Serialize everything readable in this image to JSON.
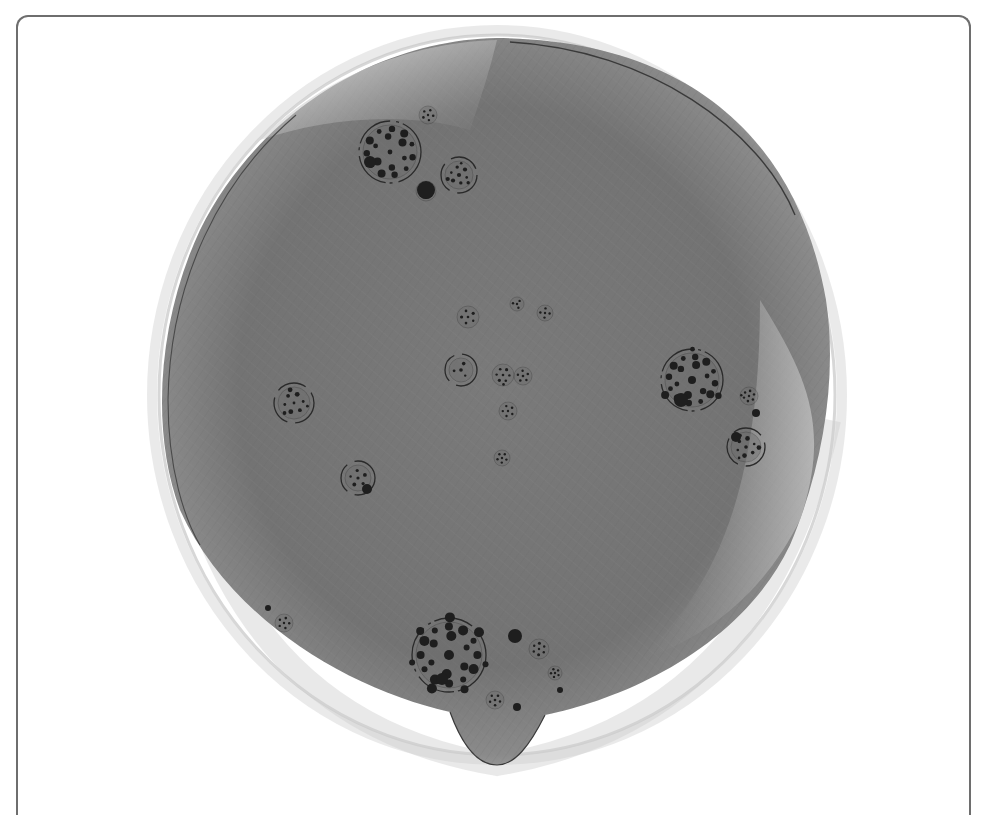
{
  "figure": {
    "kind": "network-graph",
    "colors": {
      "background": "#ffffff",
      "frame_border": "#6e6e6e",
      "edge_mass_dark": "#6f6f6f",
      "edge_mass_mid": "#858585",
      "edge_mass_light": "#b4b4b4",
      "halo": "#d6d6d6",
      "node": "#1e1e1e",
      "cluster_ring": "#2a2a2a"
    },
    "hull": {
      "center": [
        497,
        400
      ],
      "rx": 332,
      "ry": 355,
      "bottom_spike": [
        497,
        765
      ]
    },
    "clusters": [
      {
        "name": "top-left-community",
        "cx": 390,
        "cy": 152,
        "r": 27,
        "nodes": 18
      },
      {
        "name": "top-small-a",
        "cx": 428,
        "cy": 115,
        "r": 9,
        "nodes": 6
      },
      {
        "name": "top-small-b",
        "cx": 459,
        "cy": 175,
        "r": 14,
        "nodes": 10
      },
      {
        "name": "top-hub",
        "cx": 426,
        "cy": 191,
        "r": 10,
        "nodes": 1
      },
      {
        "name": "center-a",
        "cx": 468,
        "cy": 317,
        "r": 11,
        "nodes": 6
      },
      {
        "name": "center-b",
        "cx": 517,
        "cy": 304,
        "r": 7,
        "nodes": 4
      },
      {
        "name": "center-c",
        "cx": 545,
        "cy": 313,
        "r": 8,
        "nodes": 5
      },
      {
        "name": "center-d",
        "cx": 503,
        "cy": 375,
        "r": 11,
        "nodes": 8
      },
      {
        "name": "center-e",
        "cx": 523,
        "cy": 376,
        "r": 9,
        "nodes": 6
      },
      {
        "name": "center-f",
        "cx": 508,
        "cy": 411,
        "r": 9,
        "nodes": 6
      },
      {
        "name": "center-g",
        "cx": 502,
        "cy": 458,
        "r": 8,
        "nodes": 6
      },
      {
        "name": "center-h",
        "cx": 461,
        "cy": 370,
        "r": 12,
        "nodes": 4
      },
      {
        "name": "left-community",
        "cx": 294,
        "cy": 403,
        "r": 16,
        "nodes": 10
      },
      {
        "name": "left-small",
        "cx": 358,
        "cy": 478,
        "r": 13,
        "nodes": 6
      },
      {
        "name": "right-community",
        "cx": 692,
        "cy": 380,
        "r": 27,
        "nodes": 22
      },
      {
        "name": "right-small-a",
        "cx": 749,
        "cy": 396,
        "r": 9,
        "nodes": 8
      },
      {
        "name": "right-small-b",
        "cx": 746,
        "cy": 447,
        "r": 15,
        "nodes": 10
      },
      {
        "name": "bottom-community",
        "cx": 449,
        "cy": 655,
        "r": 33,
        "nodes": 26
      },
      {
        "name": "bottom-small-a",
        "cx": 539,
        "cy": 649,
        "r": 10,
        "nodes": 7
      },
      {
        "name": "bottom-small-b",
        "cx": 555,
        "cy": 673,
        "r": 7,
        "nodes": 6
      },
      {
        "name": "bottom-small-c",
        "cx": 495,
        "cy": 700,
        "r": 9,
        "nodes": 6
      },
      {
        "name": "bottom-left-small",
        "cx": 284,
        "cy": 623,
        "r": 9,
        "nodes": 6
      }
    ],
    "hubs": [
      {
        "cx": 426,
        "cy": 190,
        "r": 9
      },
      {
        "cx": 370,
        "cy": 162,
        "r": 6
      },
      {
        "cx": 515,
        "cy": 636,
        "r": 7
      },
      {
        "cx": 442,
        "cy": 679,
        "r": 6
      },
      {
        "cx": 681,
        "cy": 400,
        "r": 7
      },
      {
        "cx": 736,
        "cy": 437,
        "r": 5
      },
      {
        "cx": 367,
        "cy": 489,
        "r": 5
      },
      {
        "cx": 756,
        "cy": 413,
        "r": 4
      },
      {
        "cx": 517,
        "cy": 707,
        "r": 4
      },
      {
        "cx": 560,
        "cy": 690,
        "r": 3
      },
      {
        "cx": 268,
        "cy": 608,
        "r": 3
      }
    ]
  }
}
